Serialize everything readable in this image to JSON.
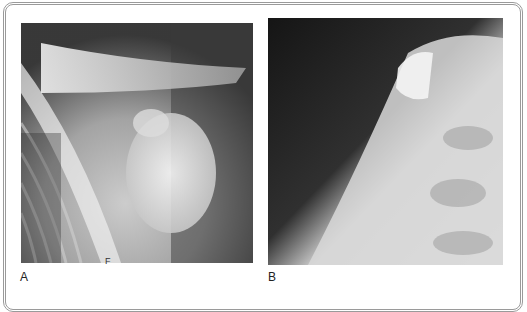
{
  "figure": {
    "panels": [
      {
        "label": "A",
        "description": "Shoulder radiograph, AP view showing clavicle, acromion, coracoid and humeral head",
        "marker": "F"
      },
      {
        "label": "B",
        "description": "Shoulder radiograph, oblique/lateral view of humeral head and scapula"
      }
    ],
    "colors": {
      "frame": "#9a9a9a",
      "background": "#ffffff",
      "xray_dark": "#1a1a1a"
    }
  }
}
